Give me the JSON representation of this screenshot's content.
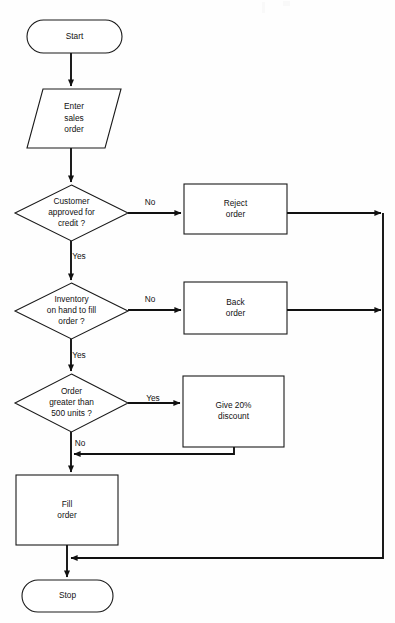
{
  "diagram": {
    "type": "flowchart",
    "orientation": "top-to-bottom",
    "background_color": "#fefefe",
    "line_color": "#111111",
    "shape_fill": "#ffffff"
  },
  "nodes": [
    {
      "id": "start",
      "shape": "terminator",
      "lines": [
        "Start"
      ],
      "x": 27,
      "y": 20,
      "w": 95,
      "h": 33
    },
    {
      "id": "enter-sales-order",
      "shape": "parallelogram",
      "lines": [
        "Enter",
        "sales",
        "order"
      ],
      "x": 27,
      "y": 89,
      "w": 94,
      "h": 59
    },
    {
      "id": "customer-approved-for-credit",
      "shape": "decision",
      "lines": [
        "Customer",
        "approved for",
        "credit ?"
      ],
      "x": 15,
      "y": 185,
      "w": 113,
      "h": 56
    },
    {
      "id": "reject-order",
      "shape": "process",
      "lines": [
        "Reject",
        "order"
      ],
      "x": 184,
      "y": 184,
      "w": 103,
      "h": 50
    },
    {
      "id": "inventory-on-hand",
      "shape": "decision",
      "lines": [
        "Inventory",
        "on hand to fill",
        "order ?"
      ],
      "x": 15,
      "y": 283,
      "w": 113,
      "h": 56
    },
    {
      "id": "back-order",
      "shape": "process",
      "lines": [
        "Back",
        "order"
      ],
      "x": 184,
      "y": 282,
      "w": 103,
      "h": 52
    },
    {
      "id": "order-greater-than-500",
      "shape": "decision",
      "lines": [
        "Order",
        "greater than",
        "500 units ?"
      ],
      "x": 15,
      "y": 374,
      "w": 113,
      "h": 58
    },
    {
      "id": "give-20-percent-discount",
      "shape": "process",
      "lines": [
        "Give 20%",
        "discount"
      ],
      "x": 183,
      "y": 376,
      "w": 101,
      "h": 71
    },
    {
      "id": "fill-order",
      "shape": "process",
      "lines": [
        "Fill",
        "order"
      ],
      "x": 16,
      "y": 475,
      "w": 102,
      "h": 70
    },
    {
      "id": "stop",
      "shape": "terminator",
      "lines": [
        "Stop"
      ],
      "x": 22,
      "y": 580,
      "w": 91,
      "h": 32
    }
  ],
  "edge_labels": [
    {
      "id": "credit-no",
      "text": "No",
      "x": 150,
      "y": 203
    },
    {
      "id": "credit-yes",
      "text": "Yes",
      "x": 79,
      "y": 257
    },
    {
      "id": "inventory-no",
      "text": "No",
      "x": 150,
      "y": 300
    },
    {
      "id": "inventory-yes",
      "text": "Yes",
      "x": 79,
      "y": 356
    },
    {
      "id": "order-yes",
      "text": "Yes",
      "x": 153,
      "y": 399
    },
    {
      "id": "order-no",
      "text": "No",
      "x": 80,
      "y": 444
    }
  ],
  "connectors": [
    {
      "id": "start-to-enter",
      "path": "M 71 53 L 71 86"
    },
    {
      "id": "enter-to-credit-decision",
      "path": "M 71 148 L 71 182"
    },
    {
      "id": "credit-no-to-reject",
      "path": "M 128 213 L 181 213"
    },
    {
      "id": "reject-to-right-rail",
      "path": "M 287 213 L 381 213"
    },
    {
      "id": "credit-yes-to-inventory",
      "path": "M 71 241 L 71 280"
    },
    {
      "id": "inventory-no-to-backorder",
      "path": "M 128 310 L 181 310"
    },
    {
      "id": "backorder-to-right-rail",
      "path": "M 287 310 L 381 310"
    },
    {
      "id": "inventory-yes-to-order",
      "path": "M 71 339 L 71 371"
    },
    {
      "id": "order-yes-to-discount",
      "path": "M 128 403 L 180 403"
    },
    {
      "id": "discount-to-merge",
      "path": "M 234 447 L 234 454 L 74 454"
    },
    {
      "id": "order-no-to-fill",
      "path": "M 71 432 L 71 472"
    },
    {
      "id": "fill-to-stop",
      "path": "M 67 545 L 67 577"
    },
    {
      "id": "right-rail-down-to-return",
      "path": "M 383 213 L 383 558 L 71 558"
    }
  ]
}
